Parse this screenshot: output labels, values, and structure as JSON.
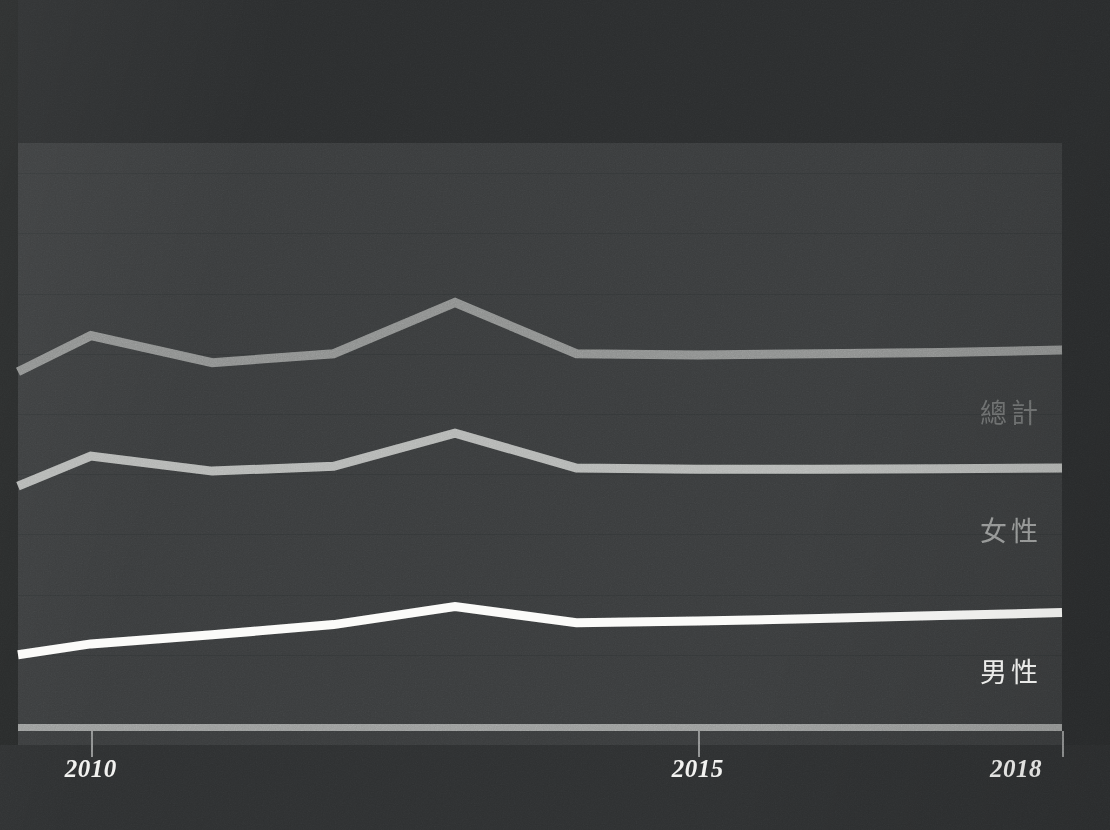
{
  "chart_data": {
    "type": "line",
    "title": "",
    "subtitle": "",
    "xlabel": "",
    "ylabel": "",
    "grid": true,
    "legend_position": "right-inline",
    "x": [
      2009.4,
      2010,
      2011,
      2012,
      2013,
      2014,
      2015,
      2016,
      2017,
      2018
    ],
    "xlim": [
      2009.4,
      2018
    ],
    "ylim": [
      0,
      100
    ],
    "tick_labels": [
      "2010",
      "2015",
      "2018"
    ],
    "tick_years": [
      2010,
      2015,
      2018
    ],
    "series": [
      {
        "name": "總計",
        "color": "#8d8f8e",
        "label_color": "#6e7070",
        "values": [
          62.0,
          68.0,
          63.5,
          65.0,
          73.5,
          65.0,
          64.8,
          65.0,
          65.2,
          65.6
        ]
      },
      {
        "name": "女性",
        "color": "#b4b6b4",
        "label_color": "#9b9d9c",
        "values": [
          43.0,
          48.0,
          45.5,
          46.3,
          51.8,
          46.0,
          45.8,
          45.8,
          45.9,
          46.0
        ]
      },
      {
        "name": "男性",
        "color": "#fbfbf9",
        "label_color": "#fbfbf9",
        "values": [
          15.0,
          16.8,
          18.3,
          20.0,
          23.0,
          20.3,
          20.6,
          21.0,
          21.5,
          22.0
        ]
      }
    ]
  },
  "axis": {
    "ticks": [
      {
        "label": "2010",
        "year": 2010
      },
      {
        "label": "2015",
        "year": 2015
      },
      {
        "label": "2018",
        "year": 2018
      }
    ]
  },
  "legend": {
    "items": [
      {
        "label": "總計"
      },
      {
        "label": "女性"
      },
      {
        "label": "男性"
      }
    ]
  },
  "colors": {
    "background": "#313334",
    "plot_background": "#3a3c3d",
    "axis": "#9a9c9b",
    "gridline": "#343637",
    "total": "#8d8f8e",
    "female": "#b4b6b4",
    "male": "#fbfbf9"
  }
}
